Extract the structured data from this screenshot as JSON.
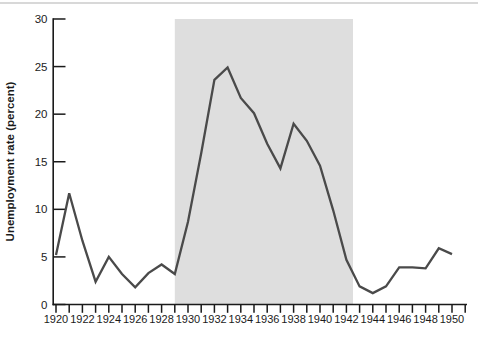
{
  "page": {
    "background_color": "#ffffff",
    "top_divider_color": "#d8d8d8"
  },
  "chart_data": {
    "type": "line",
    "title": "",
    "xlabel": "",
    "ylabel": "Unemployment rate (percent)",
    "x": [
      1920,
      1921,
      1922,
      1923,
      1924,
      1925,
      1926,
      1927,
      1928,
      1929,
      1930,
      1931,
      1932,
      1933,
      1934,
      1935,
      1936,
      1937,
      1938,
      1939,
      1940,
      1941,
      1942,
      1943,
      1944,
      1945,
      1946,
      1947,
      1948,
      1949,
      1950
    ],
    "series": [
      {
        "name": "Unemployment rate (percent)",
        "values": [
          5.2,
          11.7,
          6.7,
          2.4,
          5.0,
          3.2,
          1.8,
          3.3,
          4.2,
          3.2,
          8.7,
          15.9,
          23.6,
          24.9,
          21.7,
          20.1,
          16.9,
          14.3,
          19.0,
          17.2,
          14.6,
          9.9,
          4.7,
          1.9,
          1.2,
          1.9,
          3.9,
          3.9,
          3.8,
          5.9,
          5.3
        ]
      }
    ],
    "ylim": [
      0,
      30
    ],
    "xlim": [
      1920,
      1951
    ],
    "y_ticks": [
      0,
      5,
      10,
      15,
      20,
      25,
      30
    ],
    "y_tick_labels": [
      "0",
      "5",
      "10",
      "15",
      "20",
      "25",
      "30"
    ],
    "x_tick_step": 1,
    "x_label_years": [
      1920,
      1922,
      1924,
      1926,
      1928,
      1930,
      1932,
      1934,
      1936,
      1938,
      1940,
      1942,
      1944,
      1946,
      1948,
      1950
    ],
    "x_tick_labels": [
      "1920",
      "1922",
      "1924",
      "1926",
      "1928",
      "1930",
      "1932",
      "1934",
      "1936",
      "1938",
      "1940",
      "1942",
      "1944",
      "1946",
      "1948",
      "1950"
    ],
    "shaded_region": {
      "start_year": 1929,
      "end_year": 1942.5,
      "color": "#dedede"
    },
    "line_color": "#4a4a4a",
    "axis_color": "#1a1a1a",
    "label_color": "#1b1b1b",
    "grid": false,
    "legend": false
  }
}
